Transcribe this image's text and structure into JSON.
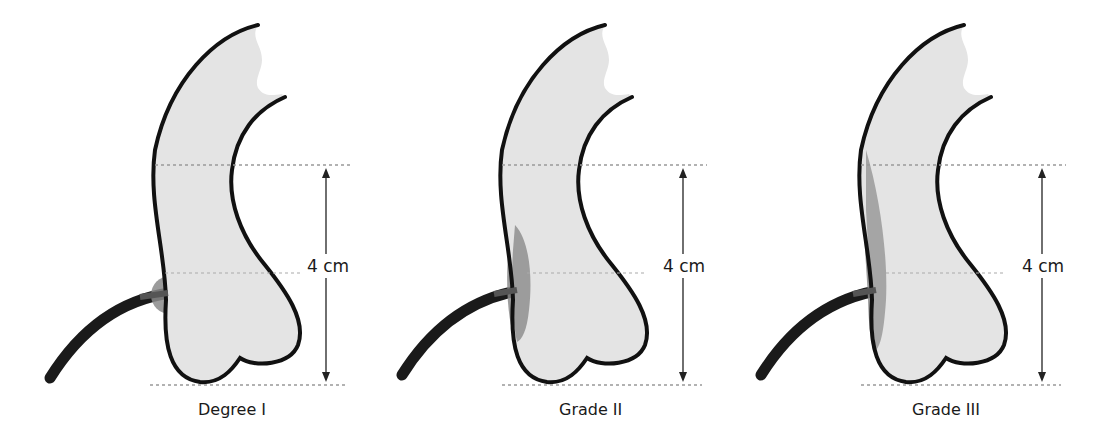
{
  "diagram": {
    "type": "medical-illustration",
    "panels": [
      {
        "label": "Degree I",
        "measurement": "4 cm",
        "shading": "small circular area at junction"
      },
      {
        "label": "Grade II",
        "measurement": "4 cm",
        "shading": "elongated shaded area along left wall"
      },
      {
        "label": "Grade III",
        "measurement": "4 cm",
        "shading": "large shaded area along entire left wall"
      }
    ],
    "colors": {
      "outline": "#111111",
      "fill": "#e4e4e4",
      "shade": "#8a8a8a",
      "dashed_line": "#999999"
    }
  }
}
